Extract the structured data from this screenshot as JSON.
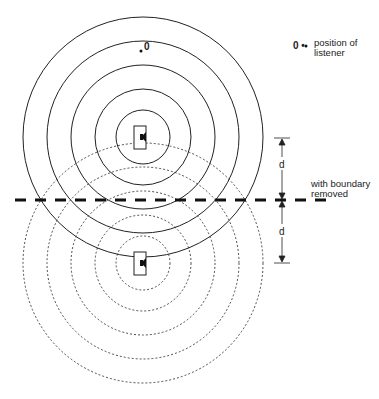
{
  "diagram": {
    "type": "mirror-image source diagram",
    "legend": {
      "symbol": "0 •",
      "text": "position of listener"
    },
    "listener_marker": "• 0",
    "boundary_label": "with boundary removed",
    "dimension_labels": {
      "upper": "d",
      "lower": "d"
    },
    "real_source": {
      "center": [
        143,
        137
      ],
      "radii": [
        27,
        48,
        72,
        96,
        120
      ],
      "line_style": "solid"
    },
    "image_source": {
      "center": [
        143,
        263
      ],
      "radii": [
        27,
        48,
        72,
        96,
        120
      ],
      "line_style": "dashed"
    },
    "boundary_line_y": 200,
    "colors": {
      "line": "#222222",
      "background": "#ffffff"
    }
  }
}
